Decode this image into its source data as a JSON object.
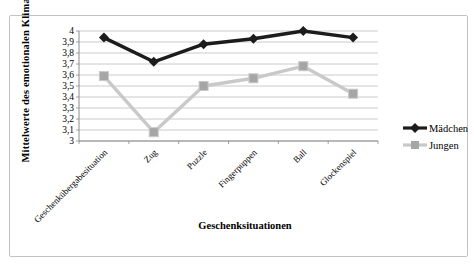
{
  "figure": {
    "background": "#ffffff",
    "border_color": "#c3c3c3"
  },
  "chart_data": {
    "type": "line",
    "title": "",
    "xlabel": "Geschenksituationen",
    "ylabel": "Mittelwerte des emotionalen Klimas*",
    "categories": [
      "Geschenkübergabesituation",
      "Zug",
      "Puzzle",
      "Fingerpuppen",
      "Ball",
      "Glockenspiel"
    ],
    "series": [
      {
        "name": "Mädchen",
        "values": [
          3.94,
          3.72,
          3.88,
          3.93,
          4.0,
          3.94
        ],
        "line_color": "#1c1c1c",
        "marker": "diamond",
        "marker_color": "#1c1c1c"
      },
      {
        "name": "Jungen",
        "values": [
          3.59,
          3.08,
          3.5,
          3.57,
          3.68,
          3.43
        ],
        "line_color": "#c9c9c9",
        "marker": "square",
        "marker_color": "#a6a6a6"
      }
    ],
    "ylim": [
      3,
      4
    ],
    "ytick_step": 0.1,
    "ytick_labels": [
      "4",
      "3,9",
      "3,8",
      "3,7",
      "3,6",
      "3,5",
      "3,4",
      "3,3",
      "3,2",
      "3,1",
      "3"
    ],
    "grid": true,
    "gridline_color": "#bdbdbd",
    "axis_color": "#8c8c8c",
    "legend_position": "right",
    "x_label_rotation": -45
  }
}
